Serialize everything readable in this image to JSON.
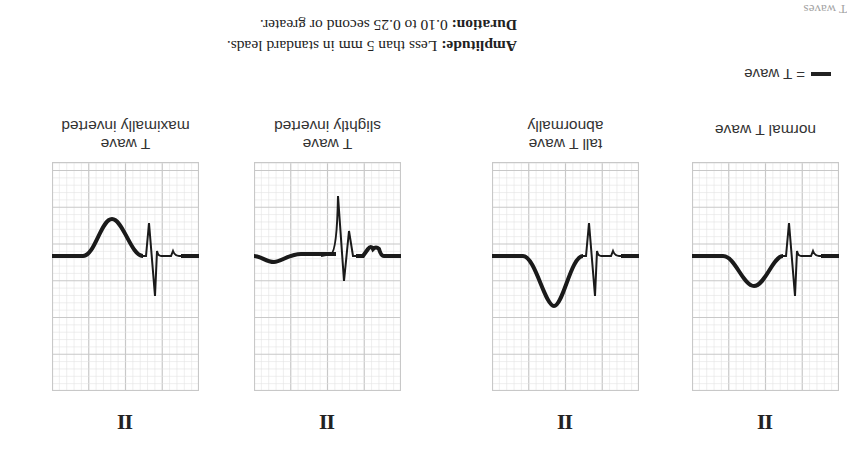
{
  "header": {
    "corner_fragment": "T waves",
    "legend": {
      "swatch_label": "= T wave"
    },
    "duration_label": "Duration:",
    "duration_value": "0.10 to 0.25 second or greater.",
    "amplitude_label": "Amplitude:",
    "amplitude_value": "Less than 5 mm in standard leads."
  },
  "panels": [
    {
      "label_line1": "normal T wave",
      "label_line2": "",
      "lead": "II",
      "t_wave": "normal"
    },
    {
      "label_line1": "abnormally",
      "label_line2": "tall T wave",
      "lead": "II",
      "t_wave": "tall"
    },
    {
      "label_line1": "slightly inverted",
      "label_line2": "T wave",
      "lead": "II",
      "t_wave": "slightly-inverted"
    },
    {
      "label_line1": "maximally inverted",
      "label_line2": "T wave",
      "lead": "II",
      "t_wave": "maximally-inverted"
    }
  ],
  "colors": {
    "grid_minor": "#e2e2e2",
    "grid_major": "#c8c8c8",
    "trace": "#1a1a1a"
  }
}
